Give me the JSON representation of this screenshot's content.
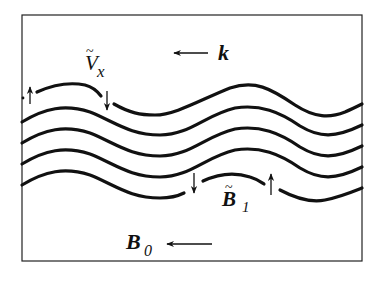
{
  "diagram": {
    "labels": {
      "wave_vector": "k",
      "velocity_perturbation": "V",
      "velocity_subscript": "x",
      "field_perturbation": "B",
      "field_perturbation_subscript": "1",
      "background_field": "B",
      "background_field_subscript": "0"
    },
    "arrows": [
      {
        "name": "k-direction",
        "direction": "left"
      },
      {
        "name": "B0-direction",
        "direction": "left"
      },
      {
        "name": "velocity-up-left",
        "direction": "up"
      },
      {
        "name": "velocity-down",
        "direction": "down"
      },
      {
        "name": "field-down",
        "direction": "down"
      },
      {
        "name": "field-up",
        "direction": "up"
      }
    ],
    "field_lines": 5,
    "colors": {
      "stroke": "#111111",
      "background": "#ffffff"
    }
  }
}
